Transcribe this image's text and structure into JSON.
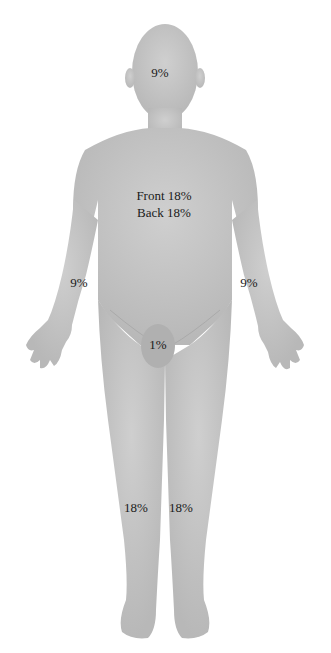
{
  "diagram": {
    "type": "body-surface-area-rule-of-nines",
    "colors": {
      "body": "#c8c8c8",
      "body_shadow": "#b4b4b4",
      "genital": "#b0b0b0",
      "text": "#1a1a1a",
      "background": "#ffffff"
    },
    "labels": {
      "head": "9%",
      "torso_front": "Front 18%",
      "torso_back": "Back 18%",
      "right_arm": "9%",
      "left_arm": "9%",
      "genitals": "1%",
      "right_leg": "18%",
      "left_leg": "18%"
    }
  }
}
